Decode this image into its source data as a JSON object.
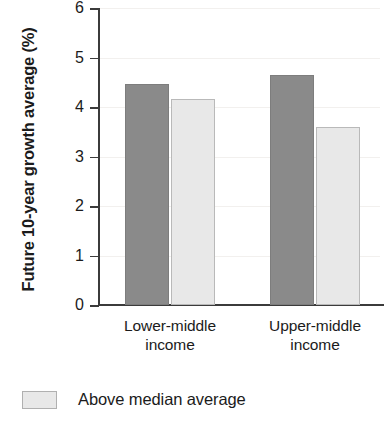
{
  "chart_data": {
    "type": "bar",
    "title": "",
    "subtitle": "",
    "xlabel": "",
    "ylabel": "Future 10-year growth average (%)",
    "categories": [
      "Lower-middle income",
      "Upper-middle income"
    ],
    "category_lines": [
      [
        "Lower-middle",
        "income"
      ],
      [
        "Upper-middle",
        "income"
      ]
    ],
    "series": [
      {
        "name": "Below median average",
        "color": "#8a8a8a",
        "values": [
          4.47,
          4.65
        ]
      },
      {
        "name": "Above median average",
        "color": "#e8e8e8",
        "values": [
          4.16,
          3.6
        ]
      }
    ],
    "ylim": [
      0,
      6
    ],
    "ytick_values": [
      6,
      5,
      4,
      3,
      2,
      1,
      0
    ],
    "ytick_labels": [
      "6",
      "5",
      "4",
      "3",
      "2",
      "1",
      "0"
    ],
    "grid": true,
    "grid_axis": "y",
    "legend_position": "below-left"
  },
  "legend": {
    "entries": [
      {
        "label": "Above median average",
        "color": "#e8e8e8"
      }
    ]
  },
  "colors": {
    "axis": "#3b3b3b",
    "grid": "#f2f0ee",
    "text": "#1b1b1b",
    "bar_dark": "#8a8a8a",
    "bar_light": "#e8e8e8",
    "background": "#ffffff"
  }
}
